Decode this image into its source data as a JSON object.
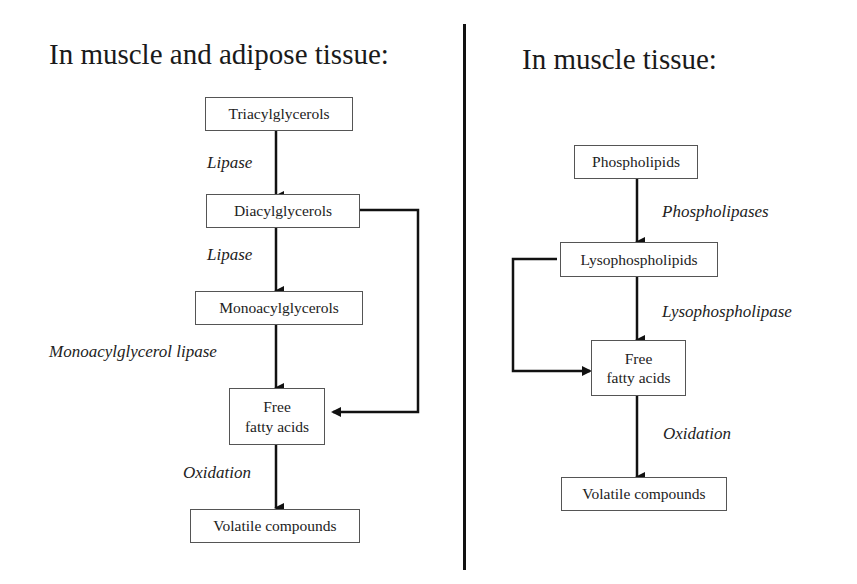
{
  "left_panel": {
    "title": "In muscle and adipose tissue:",
    "nodes": {
      "triacylglycerols": "Triacylglycerols",
      "diacylglycerols": "Diacylglycerols",
      "monoacylglycerols": "Monoacylglycerols",
      "free_fatty_acids_line1": "Free",
      "free_fatty_acids_line2": "fatty acids",
      "volatile_compounds": "Volatile compounds"
    },
    "enzymes": {
      "lipase_1": "Lipase",
      "lipase_2": "Lipase",
      "monoacylglycerol_lipase": "Monoacylglycerol lipase",
      "oxidation": "Oxidation"
    }
  },
  "right_panel": {
    "title": "In muscle tissue:",
    "nodes": {
      "phospholipids": "Phospholipids",
      "lysophospholipids": "Lysophospholipids",
      "free_fatty_acids_line1": "Free",
      "free_fatty_acids_line2": "fatty acids",
      "volatile_compounds": "Volatile compounds"
    },
    "enzymes": {
      "phospholipases": "Phospholipases",
      "lysophospholipase": "Lysophospholipase",
      "oxidation": "Oxidation"
    }
  }
}
